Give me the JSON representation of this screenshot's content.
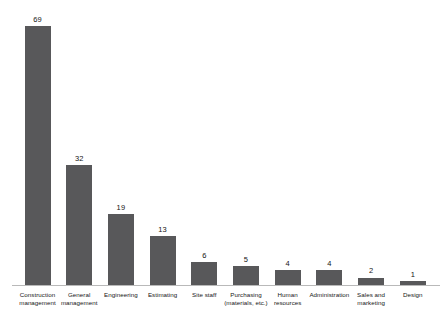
{
  "chart_data": {
    "type": "bar",
    "title": "",
    "subtitle": "",
    "xlabel": "",
    "ylabel": "",
    "ylim": [
      0,
      69
    ],
    "grid": false,
    "legend": false,
    "orientation": "vertical",
    "bar_color": "#58585a",
    "axis_color": "#b9b9b9",
    "background": "#ffffff",
    "show_value_labels": true,
    "categories": [
      "Construction management",
      "General management",
      "Engineering",
      "Estimating",
      "Site staff",
      "Purchasing (materials, etc.)",
      "Human resources",
      "Administration",
      "Sales and marketing",
      "Design"
    ],
    "category_lines": [
      [
        "Construction",
        "management"
      ],
      [
        "General",
        "management"
      ],
      [
        "Engineering"
      ],
      [
        "Estimating"
      ],
      [
        "Site staff"
      ],
      [
        "Purchasing",
        "(materials, etc.)"
      ],
      [
        "Human",
        "resources"
      ],
      [
        "Administration"
      ],
      [
        "Sales and",
        "marketing"
      ],
      [
        "Design"
      ]
    ],
    "values": [
      69,
      32,
      19,
      13,
      6,
      5,
      4,
      4,
      2,
      1
    ],
    "value_labels": [
      "69",
      "32",
      "19",
      "13",
      "6",
      "5",
      "4",
      "4",
      "2",
      "1"
    ]
  }
}
